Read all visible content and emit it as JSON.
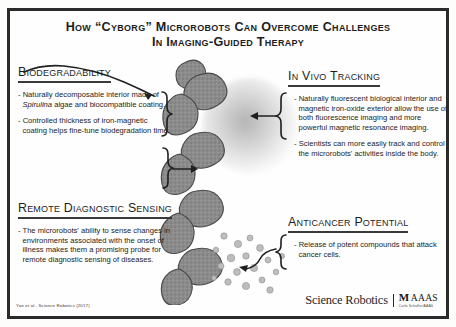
{
  "poster": {
    "title_line1": "How “Cyborg” Microrobots Can Overcome Challenges",
    "title_line2": "In Imaging-Guided Therapy",
    "accent_color": "#2b2b2b",
    "background_color": "#fefefe",
    "body_color": "#232323"
  },
  "sections": [
    {
      "id": "biodegradability",
      "heading": "Biodegradability",
      "bullets": [
        "- Naturally decomposable interior made of Spirulina algae and biocompatible coating.",
        "- Controlled thickness of iron-magnetic coating helps fine-tune biodegradation time."
      ]
    },
    {
      "id": "remote-diagnostic-sensing",
      "heading": "Remote Diagnostic Sensing",
      "bullets": [
        "- The microrobots' ability to sense changes in environments associated with the onset of illness makes them a promising probe for remote diagnostic sensing of diseases."
      ]
    },
    {
      "id": "in-vivo-tracking",
      "heading": "In Vivo Tracking",
      "bullets": [
        "- Naturally fluorescent biological interior and magnetic iron-oxide exterior allow the use of both fluorescence imaging and more powerful magnetic resonance imaging.",
        "- Scientists can more easily track and control the microrobots' activities inside the body."
      ]
    },
    {
      "id": "anticancer-potential",
      "heading": "Anticancer Potential",
      "bullets": [
        "- Release of potent compounds that attack cancer cells."
      ]
    }
  ],
  "illustration": {
    "subject": "helical spirulina microrobot",
    "glow_label": "fluorescence glow",
    "particles_label": "released compounds"
  },
  "footer": {
    "credit": "Yan et al., Science Robotics (2017)",
    "journal_logo": "Science Robotics",
    "society_mark": "M",
    "society_name": "AAAS",
    "society_tagline": "Carla Schaffer/AAAS"
  }
}
